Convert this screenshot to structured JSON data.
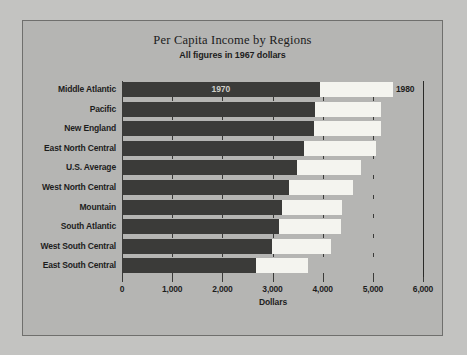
{
  "chart_data": {
    "type": "bar",
    "orientation": "horizontal",
    "title": "Per Capita Income by Regions",
    "subtitle": "All figures in 1967 dollars",
    "xlabel": "Dollars",
    "ylabel": "",
    "xlim": [
      0,
      6000
    ],
    "xticks": [
      0,
      1000,
      2000,
      3000,
      4000,
      5000,
      6000
    ],
    "xticklabels": [
      "0",
      "1,000",
      "2,000",
      "3,000",
      "4,000",
      "5,000",
      "6,000"
    ],
    "grid": false,
    "legend": {
      "position": "in-bars",
      "entries": [
        {
          "name": "1970",
          "color": "#3b3b39"
        },
        {
          "name": "1980",
          "color": "#f4f4ef"
        }
      ]
    },
    "categories": [
      "Middle Atlantic",
      "Pacific",
      "New England",
      "East North Central",
      "U.S. Average",
      "West North Central",
      "Mountain",
      "South Atlantic",
      "West South Central",
      "East South Central"
    ],
    "series": [
      {
        "name": "1970",
        "color": "#3b3b39",
        "values": [
          3930,
          3820,
          3800,
          3600,
          3470,
          3310,
          3170,
          3110,
          2970,
          2650
        ]
      },
      {
        "name": "1980",
        "color": "#f4f4ef",
        "values": [
          5380,
          5140,
          5140,
          5040,
          4740,
          4580,
          4360,
          4340,
          4140,
          3690
        ]
      }
    ]
  }
}
